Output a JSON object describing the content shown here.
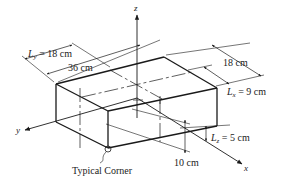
{
  "figure": {
    "axes": {
      "x": "x",
      "y": "y",
      "z": "z"
    },
    "dimensions": {
      "ly_label": "L",
      "ly_sub": "y",
      "ly_value": " = 18 cm",
      "length_36": "36 cm",
      "width_18": "18 cm",
      "lx_label": "L",
      "lx_sub": "x",
      "lx_value": " = 9 cm",
      "lz_label": "L",
      "lz_sub": "z",
      "lz_value": " = 5 cm",
      "height_10": "10 cm"
    },
    "corner_label": "Typical Corner",
    "colors": {
      "line": "#1a1a1a",
      "background": "#ffffff"
    }
  }
}
